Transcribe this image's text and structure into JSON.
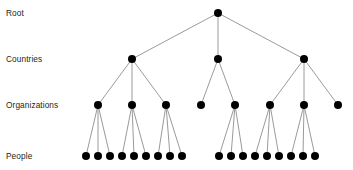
{
  "diagram": {
    "background_color": "#ffffff",
    "node_color": "#000000",
    "edge_color": "#808080",
    "text_color": "#231f20",
    "node_radius": 4,
    "edge_width": 0.8,
    "levels": [
      {
        "id": "root",
        "label": "Root",
        "label_y": 13,
        "y": 13,
        "count": 1
      },
      {
        "id": "countries",
        "label": "Countries",
        "label_y": 59,
        "y": 59,
        "count": 3
      },
      {
        "id": "organizations",
        "label": "Organizations",
        "label_y": 105,
        "y": 105,
        "count": 8
      },
      {
        "id": "people",
        "label": "People",
        "label_y": 156,
        "y": 156,
        "count": 18
      }
    ],
    "nodes": [
      {
        "id": "r0",
        "level": "root",
        "x": 218,
        "y": 13,
        "parent": null
      },
      {
        "id": "c0",
        "level": "countries",
        "x": 132,
        "y": 59,
        "parent": "r0"
      },
      {
        "id": "c1",
        "level": "countries",
        "x": 218,
        "y": 59,
        "parent": "r0"
      },
      {
        "id": "c2",
        "level": "countries",
        "x": 304,
        "y": 59,
        "parent": "r0"
      },
      {
        "id": "o0",
        "level": "organizations",
        "x": 98,
        "y": 105,
        "parent": "c0"
      },
      {
        "id": "o1",
        "level": "organizations",
        "x": 132,
        "y": 105,
        "parent": "c0"
      },
      {
        "id": "o2",
        "level": "organizations",
        "x": 166,
        "y": 105,
        "parent": "c0"
      },
      {
        "id": "o3",
        "level": "organizations",
        "x": 201,
        "y": 105,
        "parent": "c1"
      },
      {
        "id": "o4",
        "level": "organizations",
        "x": 235,
        "y": 105,
        "parent": "c1"
      },
      {
        "id": "o5",
        "level": "organizations",
        "x": 270,
        "y": 105,
        "parent": "c2"
      },
      {
        "id": "o6",
        "level": "organizations",
        "x": 304,
        "y": 105,
        "parent": "c2"
      },
      {
        "id": "o7",
        "level": "organizations",
        "x": 338,
        "y": 105,
        "parent": "c2"
      },
      {
        "id": "p0",
        "level": "people",
        "x": 86,
        "y": 156,
        "parent": "o0"
      },
      {
        "id": "p1",
        "level": "people",
        "x": 98,
        "y": 156,
        "parent": "o0"
      },
      {
        "id": "p2",
        "level": "people",
        "x": 110,
        "y": 156,
        "parent": "o0"
      },
      {
        "id": "p3",
        "level": "people",
        "x": 122,
        "y": 156,
        "parent": "o1"
      },
      {
        "id": "p4",
        "level": "people",
        "x": 134,
        "y": 156,
        "parent": "o1"
      },
      {
        "id": "p5",
        "level": "people",
        "x": 146,
        "y": 156,
        "parent": "o1"
      },
      {
        "id": "p6",
        "level": "people",
        "x": 158,
        "y": 156,
        "parent": "o2"
      },
      {
        "id": "p7",
        "level": "people",
        "x": 170,
        "y": 156,
        "parent": "o2"
      },
      {
        "id": "p8",
        "level": "people",
        "x": 182,
        "y": 156,
        "parent": "o2"
      },
      {
        "id": "p9",
        "level": "people",
        "x": 219,
        "y": 156,
        "parent": "o4"
      },
      {
        "id": "p10",
        "level": "people",
        "x": 231,
        "y": 156,
        "parent": "o4"
      },
      {
        "id": "p11",
        "level": "people",
        "x": 243,
        "y": 156,
        "parent": "o4"
      },
      {
        "id": "p12",
        "level": "people",
        "x": 255,
        "y": 156,
        "parent": "o5"
      },
      {
        "id": "p13",
        "level": "people",
        "x": 267,
        "y": 156,
        "parent": "o5"
      },
      {
        "id": "p14",
        "level": "people",
        "x": 279,
        "y": 156,
        "parent": "o5"
      },
      {
        "id": "p15",
        "level": "people",
        "x": 291,
        "y": 156,
        "parent": "o6"
      },
      {
        "id": "p16",
        "level": "people",
        "x": 303,
        "y": 156,
        "parent": "o6"
      },
      {
        "id": "p17",
        "level": "people",
        "x": 315,
        "y": 156,
        "parent": "o6"
      }
    ]
  }
}
